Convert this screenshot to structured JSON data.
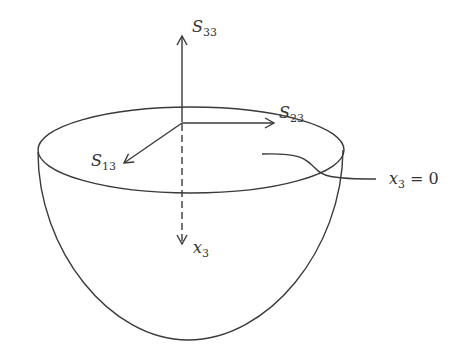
{
  "diagram": {
    "labels": {
      "s33": {
        "base": "S",
        "sub": "33"
      },
      "s23": {
        "base": "S",
        "sub": "23"
      },
      "s13": {
        "base": "S",
        "sub": "13"
      },
      "x3": {
        "base": "x",
        "sub": "3"
      },
      "surface": {
        "base": "x",
        "sub": "3",
        "rest": " = 0"
      }
    },
    "colors": {
      "stroke": "#3a3a3a",
      "text": "#333333",
      "background": "#ffffff"
    }
  }
}
